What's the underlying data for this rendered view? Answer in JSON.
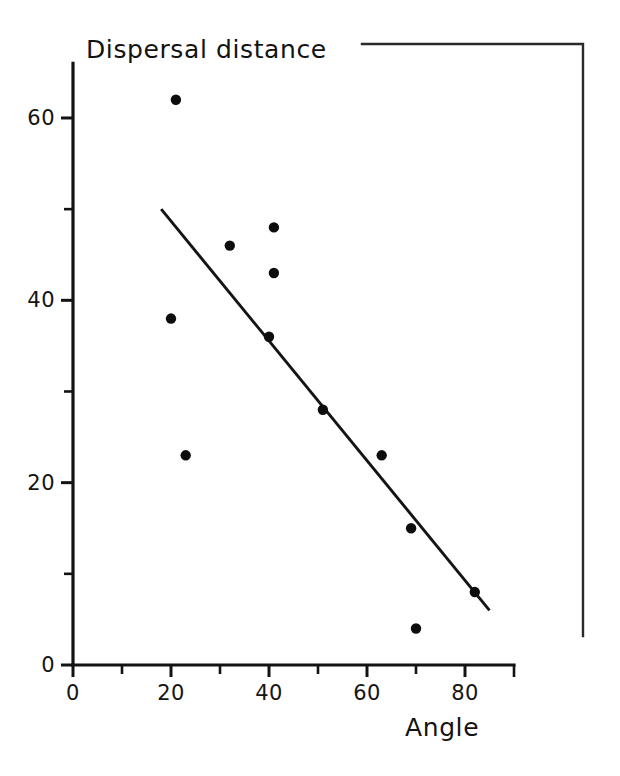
{
  "chart_data": {
    "type": "scatter",
    "title": "Dispersal distance",
    "xlabel": "Angle",
    "ylabel": "Dispersal distance",
    "xlim": [
      0,
      90
    ],
    "ylim": [
      0,
      66
    ],
    "grid": false,
    "legend": "none",
    "x_ticks_major": [
      0,
      20,
      40,
      60,
      80
    ],
    "x_ticks_minor": [
      10,
      30,
      50,
      70
    ],
    "x_tick_labels": [
      "0",
      "20",
      "40",
      "60",
      "80"
    ],
    "y_ticks_major": [
      0,
      20,
      40,
      60
    ],
    "y_ticks_minor": [
      10,
      30,
      50
    ],
    "y_tick_labels": [
      "0",
      "20",
      "40",
      "60"
    ],
    "points": [
      {
        "x": 21,
        "y": 62
      },
      {
        "x": 20,
        "y": 38
      },
      {
        "x": 23,
        "y": 23
      },
      {
        "x": 32,
        "y": 46
      },
      {
        "x": 41,
        "y": 48
      },
      {
        "x": 41,
        "y": 43
      },
      {
        "x": 40,
        "y": 36
      },
      {
        "x": 51,
        "y": 28
      },
      {
        "x": 63,
        "y": 23
      },
      {
        "x": 69,
        "y": 15
      },
      {
        "x": 70,
        "y": 4
      },
      {
        "x": 82,
        "y": 8
      }
    ],
    "trend_line": {
      "x_start": 18,
      "y_start": 50,
      "x_end": 85,
      "y_end": 6
    },
    "colors": {
      "point": "#0d0d0d",
      "line": "#141414",
      "axis": "#131313",
      "frame": "#2a2a2a",
      "background": "#ffffff"
    }
  },
  "figure": {
    "name": "dispersal-distance-scatter"
  }
}
